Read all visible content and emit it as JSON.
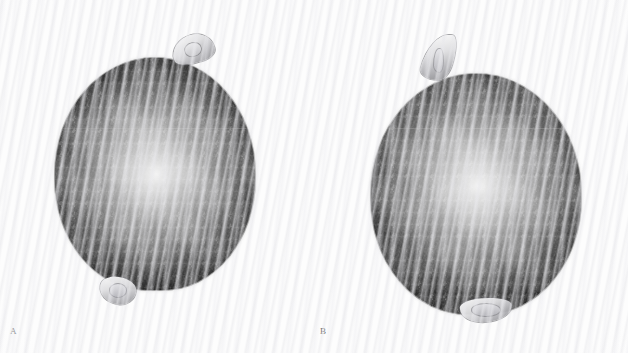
{
  "figure": {
    "background_color": "#fdfdfd",
    "specimen_fill_color": "#343434",
    "appendage_color": "#e2e2e4",
    "label_color": "#6a6a6a",
    "width_px": 628,
    "height_px": 353
  },
  "panels": [
    {
      "id": "panel-a",
      "label": "A",
      "specimen": {
        "name": "specimen-a",
        "shape": "subglobose-ovoid",
        "surface": "dense dark mottled reticulate texture",
        "left_px": 55,
        "top_px": 58,
        "width_px": 200,
        "height_px": 232,
        "seam_offset_px": 70,
        "appendages": [
          {
            "name": "micropylar-beak",
            "position": "top-right",
            "left_px": 172,
            "top_px": 35,
            "width_px": 42,
            "height_px": 28
          },
          {
            "name": "hilum-knob",
            "position": "bottom-left",
            "left_px": 100,
            "top_px": 277,
            "width_px": 36,
            "height_px": 27
          }
        ]
      }
    },
    {
      "id": "panel-b",
      "label": "B",
      "specimen": {
        "name": "specimen-b",
        "shape": "subglobose-ovoid",
        "surface": "dense dark mottled reticulate texture",
        "left_px": 371,
        "top_px": 74,
        "width_px": 210,
        "height_px": 240,
        "seam_offset_px": 54,
        "appendages": [
          {
            "name": "micropylar-beak",
            "position": "top-left",
            "left_px": 424,
            "top_px": 34,
            "width_px": 30,
            "height_px": 46
          },
          {
            "name": "hilum-knob",
            "position": "bottom-center",
            "left_px": 460,
            "top_px": 298,
            "width_px": 52,
            "height_px": 24
          }
        ]
      }
    }
  ]
}
